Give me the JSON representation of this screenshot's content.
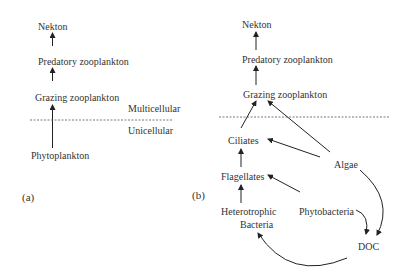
{
  "panel_a": {
    "label": "(a)",
    "nodes": {
      "nekton": "Nekton",
      "predatory": "Predatory zooplankton",
      "grazing": "Grazing zooplankton",
      "phytoplankton": "Phytoplankton"
    },
    "zones": {
      "upper": "Multicellular",
      "lower": "Unicellular"
    }
  },
  "panel_b": {
    "label": "(b)",
    "nodes": {
      "nekton": "Nekton",
      "predatory": "Predatory zooplankton",
      "grazing": "Grazing zooplankton",
      "ciliates": "Ciliates",
      "algae": "Algae",
      "flagellates": "Flagellates",
      "hetero_line1": "Heterotrophic",
      "hetero_line2": "Bacteria",
      "phytobacteria": "Phytobacteria",
      "doc": "DOC"
    }
  },
  "colors": {
    "line": "#222222",
    "text": "#333333",
    "dash": "#555555"
  }
}
